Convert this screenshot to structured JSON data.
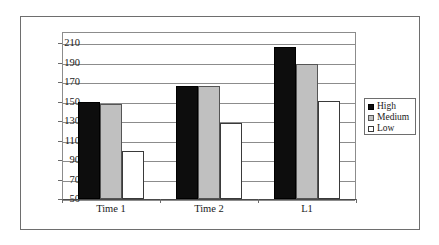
{
  "chart_data": {
    "type": "bar",
    "title": "",
    "xlabel": "",
    "ylabel": "Syllables per minute",
    "categories": [
      "Time 1",
      "Time 2",
      "L1"
    ],
    "series": [
      {
        "name": "High",
        "color": "#0d0d0d",
        "values": [
          150,
          166,
          206
        ]
      },
      {
        "name": "Medium",
        "color": "#c0c0c0",
        "values": [
          147,
          166,
          188
        ]
      },
      {
        "name": "Low",
        "color": "#ffffff",
        "values": [
          99,
          128,
          151
        ]
      }
    ],
    "ylim": [
      50,
      210
    ],
    "ytick_values": [
      50,
      70,
      90,
      110,
      130,
      150,
      170,
      190,
      210
    ],
    "ytick_labels": [
      "50",
      "70",
      "90",
      "110",
      "130",
      "150",
      "170",
      "190",
      "210"
    ],
    "grid": true,
    "grid_axis": "y",
    "legend_position": "right",
    "legend_entries": [
      "High",
      "Medium",
      "Low"
    ]
  }
}
